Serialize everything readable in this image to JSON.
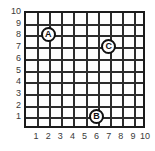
{
  "chart_data": {
    "type": "scatter",
    "title": "",
    "xlabel": "",
    "ylabel": "",
    "xlim": [
      0,
      10
    ],
    "ylim": [
      0,
      10
    ],
    "grid": true,
    "legend": "none",
    "x_ticks": [
      "1",
      "2",
      "3",
      "4",
      "5",
      "6",
      "7",
      "8",
      "9",
      "10"
    ],
    "y_ticks": [
      "10",
      "9",
      "8",
      "7",
      "6",
      "5",
      "4",
      "3",
      "2",
      "1"
    ],
    "points": [
      {
        "label": "A",
        "x": 2,
        "y": 8
      },
      {
        "label": "C",
        "x": 7,
        "y": 7
      },
      {
        "label": "B",
        "x": 6,
        "y": 1
      }
    ]
  },
  "colors": {
    "grid_line": "#2b2b2b",
    "border": "#1a1a1a",
    "marker_outline": "#111111",
    "marker_fill": "#ffffff",
    "label_text": "#3a3a3a",
    "background": "#ffffff"
  }
}
